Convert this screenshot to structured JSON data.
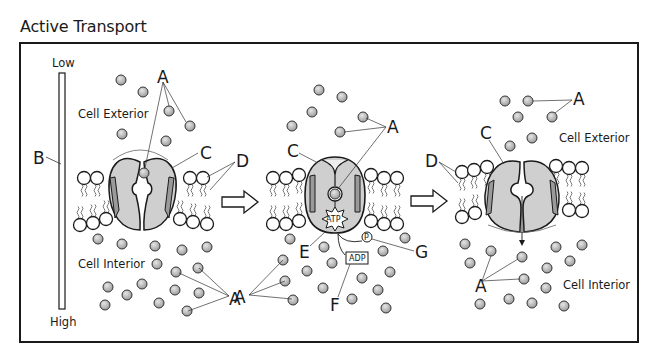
{
  "title": "Active Transport",
  "gradient_bar": {
    "top_label": "Low",
    "bottom_label": "High",
    "letter": "B"
  },
  "regions": {
    "exterior": "Cell Exterior",
    "interior": "Cell Interior"
  },
  "letters": {
    "solute": "A",
    "gradient": "B",
    "carrier_protein": "C",
    "phospholipid": "D",
    "atp_site": "E",
    "adp": "F",
    "phosphate": "G"
  },
  "molecules": {
    "atp": "ATP",
    "adp": "ADP",
    "phosphate": "P"
  },
  "colors": {
    "stroke": "#1a1a1a",
    "protein_fill": "#cfcfcf",
    "protein_dark": "#9a9a9a",
    "solute_fill": "#b8b8b8",
    "background": "#ffffff"
  },
  "stages": [
    {
      "name": "stage-1-open-to-exterior"
    },
    {
      "name": "stage-2-atp-binding"
    },
    {
      "name": "stage-3-open-to-interior"
    }
  ]
}
